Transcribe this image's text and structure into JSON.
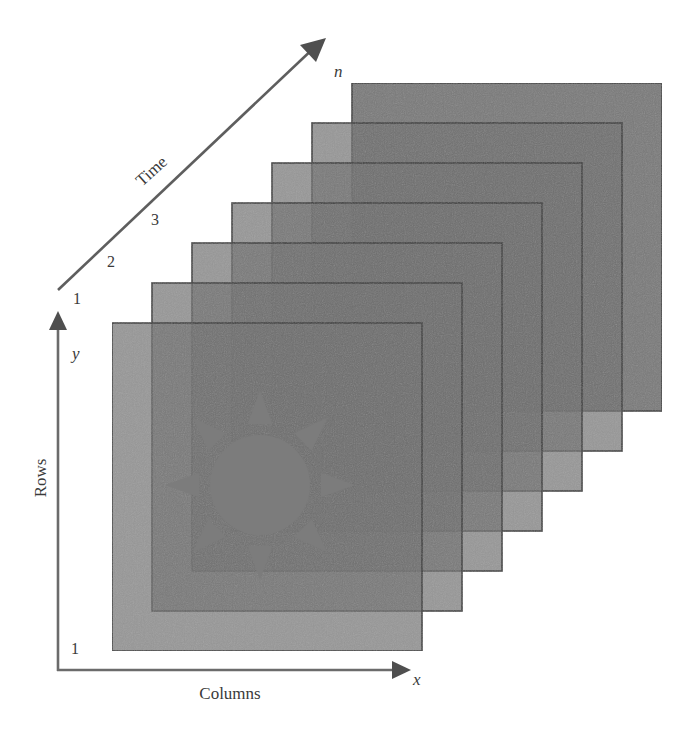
{
  "diagram": {
    "axes": {
      "time": {
        "label": "Time",
        "end_label": "n",
        "ticks": [
          "1",
          "2",
          "3"
        ]
      },
      "rows": {
        "label": "Rows",
        "var": "y",
        "origin_tick": "1"
      },
      "columns": {
        "label": "Columns",
        "var": "x"
      }
    },
    "frames": {
      "count": 7,
      "width": 310,
      "height": 328,
      "first_x": 112,
      "first_y": 323,
      "step_x": 40,
      "step_y": -40
    },
    "sun": {
      "cx": 260,
      "cy": 485,
      "r": 50,
      "rays": 8
    },
    "colors": {
      "background": "#ffffff",
      "axis": "#6b6b6b",
      "frame_fill": "#6f6f6f",
      "frame_stroke": "#3c3c3c",
      "sun_fill": "#7c7c7c",
      "text": "#3a3a3a"
    }
  }
}
